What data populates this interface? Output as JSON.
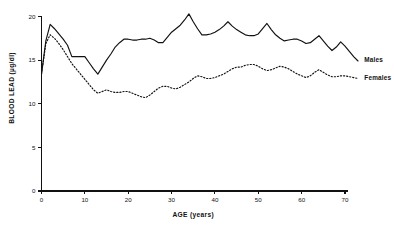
{
  "chart_data": {
    "type": "line",
    "title": "",
    "xlabel": "AGE (years)",
    "ylabel": "BLOOD LEAD (µg/dl)",
    "xlim": [
      0,
      73
    ],
    "ylim": [
      0,
      20.8
    ],
    "grid": false,
    "legend_position": "right-inline",
    "xticks": [
      0,
      10,
      20,
      30,
      40,
      50,
      60,
      70
    ],
    "xtick_labels": [
      "0",
      "10",
      "20",
      "30",
      "40",
      "50",
      "60",
      "70"
    ],
    "yticks": [
      0,
      5,
      10,
      15,
      20
    ],
    "ytick_labels": [
      "0",
      "5",
      "10",
      "15",
      "20"
    ],
    "series": [
      {
        "name": "Males",
        "style": "solid",
        "label_x": 74,
        "label_y": 15.0,
        "x": [
          0,
          1,
          2,
          3,
          4,
          5,
          6,
          7,
          8,
          9,
          10,
          11,
          12,
          13,
          14,
          15,
          16,
          17,
          18,
          19,
          20,
          21,
          22,
          23,
          24,
          25,
          26,
          27,
          28,
          29,
          30,
          31,
          32,
          33,
          34,
          35,
          36,
          37,
          38,
          39,
          40,
          41,
          42,
          43,
          44,
          45,
          46,
          47,
          48,
          49,
          50,
          51,
          52,
          53,
          54,
          55,
          56,
          57,
          58,
          59,
          60,
          61,
          62,
          63,
          64,
          65,
          66,
          67,
          68,
          69,
          70,
          71,
          72,
          73
        ],
        "values": [
          13.4,
          17.2,
          19.1,
          18.6,
          18.0,
          17.4,
          16.7,
          15.4,
          15.4,
          15.4,
          15.4,
          14.7,
          14.0,
          13.4,
          14.2,
          15.0,
          15.7,
          16.5,
          17.0,
          17.4,
          17.4,
          17.3,
          17.3,
          17.4,
          17.4,
          17.5,
          17.3,
          17.0,
          17.0,
          17.6,
          18.2,
          18.6,
          19.0,
          19.6,
          20.3,
          19.4,
          18.6,
          17.9,
          17.9,
          18.0,
          18.2,
          18.5,
          18.9,
          19.4,
          18.9,
          18.5,
          18.2,
          17.9,
          17.8,
          17.8,
          18.0,
          18.6,
          19.2,
          18.5,
          17.9,
          17.5,
          17.2,
          17.3,
          17.4,
          17.4,
          17.2,
          16.9,
          17.0,
          17.4,
          17.8,
          17.2,
          16.6,
          16.1,
          16.5,
          17.1,
          16.6,
          16.0,
          15.4,
          14.9
        ]
      },
      {
        "name": "Females",
        "style": "dotted",
        "label_x": 74,
        "label_y": 13.0,
        "x": [
          0,
          1,
          2,
          3,
          4,
          5,
          6,
          7,
          8,
          9,
          10,
          11,
          12,
          13,
          14,
          15,
          16,
          17,
          18,
          19,
          20,
          21,
          22,
          23,
          24,
          25,
          26,
          27,
          28,
          29,
          30,
          31,
          32,
          33,
          34,
          35,
          36,
          37,
          38,
          39,
          40,
          41,
          42,
          43,
          44,
          45,
          46,
          47,
          48,
          49,
          50,
          51,
          52,
          53,
          54,
          55,
          56,
          57,
          58,
          59,
          60,
          61,
          62,
          63,
          64,
          65,
          66,
          67,
          68,
          69,
          70,
          71,
          72,
          73
        ],
        "values": [
          13.4,
          16.9,
          17.9,
          17.5,
          16.9,
          16.2,
          15.4,
          14.6,
          14.0,
          13.4,
          12.8,
          12.2,
          11.6,
          11.2,
          11.4,
          11.6,
          11.4,
          11.3,
          11.3,
          11.4,
          11.4,
          11.2,
          11.0,
          10.8,
          10.7,
          11.0,
          11.4,
          11.8,
          12.0,
          12.0,
          11.8,
          11.7,
          11.9,
          12.2,
          12.5,
          12.9,
          13.2,
          13.1,
          12.9,
          12.9,
          13.0,
          13.2,
          13.4,
          13.7,
          14.0,
          14.2,
          14.2,
          14.4,
          14.5,
          14.5,
          14.3,
          14.0,
          13.8,
          13.9,
          14.1,
          14.3,
          14.2,
          14.0,
          13.7,
          13.4,
          13.2,
          13.0,
          13.2,
          13.6,
          13.9,
          13.6,
          13.3,
          13.1,
          13.1,
          13.2,
          13.2,
          13.1,
          13.0,
          12.9
        ]
      }
    ]
  }
}
